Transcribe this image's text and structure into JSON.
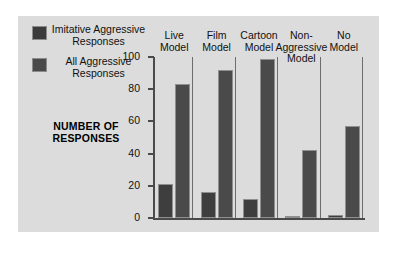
{
  "chart_data": {
    "type": "bar",
    "title": "",
    "xlabel": "",
    "ylabel": "NUMBER OF RESPONSES",
    "ylim": [
      0,
      100
    ],
    "yticks": [
      0,
      20,
      40,
      60,
      80,
      100
    ],
    "grid": false,
    "legend_position": "top-left",
    "categories": [
      "Live Model",
      "Film Model",
      "Cartoon Model",
      "Non-Aggressive Model",
      "No Model"
    ],
    "series": [
      {
        "name": "Imitative Aggressive Responses",
        "values": [
          21,
          16,
          12,
          1,
          2
        ]
      },
      {
        "name": "All Aggressive Responses",
        "values": [
          83,
          92,
          99,
          42,
          57
        ]
      }
    ]
  },
  "legend": {
    "items": [
      {
        "label": "Imitative Aggressive Responses",
        "color": "#3e3e3e",
        "swatch": "imitative"
      },
      {
        "label": "All Aggressive Responses",
        "color": "#4a4a4a",
        "swatch": "all"
      }
    ]
  },
  "axis": {
    "y_title": "NUMBER OF RESPONSES",
    "ticks": [
      "100",
      "80",
      "60",
      "40",
      "20",
      "0"
    ]
  },
  "groups": [
    {
      "label": "Live Model"
    },
    {
      "label": "Film Model"
    },
    {
      "label": "Cartoon Model"
    },
    {
      "label": "Non-Aggressive Model"
    },
    {
      "label": "No Model"
    }
  ],
  "colors": {
    "panel_background": "#dcdcdc",
    "bar_imitative": "#3e3e3e",
    "bar_all": "#4a4a4a",
    "axis": "#4a4a4a",
    "text": "#111111"
  }
}
